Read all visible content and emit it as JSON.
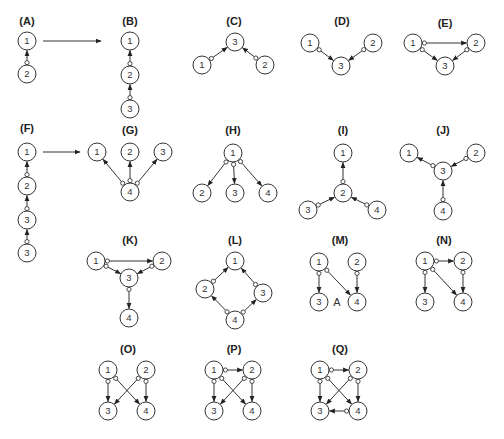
{
  "figure": {
    "node_radius": 9,
    "panels": [
      {
        "id": "A",
        "label": "(A)",
        "lx": 27,
        "ly": 25,
        "nodes": [
          {
            "n": "1",
            "x": 27,
            "y": 41
          },
          {
            "n": "2",
            "x": 27,
            "y": 74
          }
        ],
        "edges": [
          [
            "2",
            "1"
          ]
        ]
      },
      {
        "id": "B",
        "label": "(B)",
        "lx": 130,
        "ly": 25,
        "nodes": [
          {
            "n": "1",
            "x": 130,
            "y": 41
          },
          {
            "n": "2",
            "x": 130,
            "y": 75
          },
          {
            "n": "3",
            "x": 130,
            "y": 109
          }
        ],
        "edges": [
          [
            "2",
            "1"
          ],
          [
            "3",
            "2"
          ]
        ]
      },
      {
        "id": "C",
        "label": "(C)",
        "lx": 234,
        "ly": 25,
        "nodes": [
          {
            "n": "3",
            "x": 235,
            "y": 42
          },
          {
            "n": "1",
            "x": 202,
            "y": 65
          },
          {
            "n": "2",
            "x": 265,
            "y": 65
          }
        ],
        "edges": [
          [
            "1",
            "3"
          ],
          [
            "2",
            "3"
          ]
        ]
      },
      {
        "id": "D",
        "label": "(D)",
        "lx": 342,
        "ly": 25,
        "nodes": [
          {
            "n": "1",
            "x": 310,
            "y": 43
          },
          {
            "n": "2",
            "x": 373,
            "y": 43
          },
          {
            "n": "3",
            "x": 341,
            "y": 66
          }
        ],
        "edges": [
          [
            "1",
            "3"
          ],
          [
            "2",
            "3"
          ]
        ]
      },
      {
        "id": "E",
        "label": "(E)",
        "lx": 445,
        "ly": 27,
        "nodes": [
          {
            "n": "1",
            "x": 413,
            "y": 43
          },
          {
            "n": "2",
            "x": 476,
            "y": 43
          },
          {
            "n": "3",
            "x": 445,
            "y": 66
          }
        ],
        "edges": [
          [
            "1",
            "2"
          ],
          [
            "1",
            "3"
          ],
          [
            "2",
            "3"
          ]
        ]
      },
      {
        "id": "F",
        "label": "(F)",
        "lx": 27,
        "ly": 132,
        "nodes": [
          {
            "n": "1",
            "x": 27,
            "y": 152
          },
          {
            "n": "2",
            "x": 27,
            "y": 186
          },
          {
            "n": "3",
            "x": 27,
            "y": 220
          },
          {
            "n": "3",
            "x": 27,
            "y": 253
          }
        ],
        "edges": [
          [
            "2",
            "1",
            1,
            0
          ],
          [
            "3",
            "2",
            2,
            1
          ],
          [
            "3",
            "3",
            3,
            2
          ]
        ]
      },
      {
        "id": "G",
        "label": "(G)",
        "lx": 130,
        "ly": 134,
        "nodes": [
          {
            "n": "1",
            "x": 97,
            "y": 152
          },
          {
            "n": "2",
            "x": 130,
            "y": 152
          },
          {
            "n": "3",
            "x": 163,
            "y": 152
          },
          {
            "n": "4",
            "x": 130,
            "y": 192
          }
        ],
        "edges": [
          [
            "4",
            "1"
          ],
          [
            "4",
            "2"
          ],
          [
            "4",
            "3"
          ]
        ],
        "shared_tail": true
      },
      {
        "id": "H",
        "label": "(H)",
        "lx": 233,
        "ly": 134,
        "nodes": [
          {
            "n": "1",
            "x": 233,
            "y": 153
          },
          {
            "n": "2",
            "x": 202,
            "y": 193
          },
          {
            "n": "3",
            "x": 235,
            "y": 193
          },
          {
            "n": "4",
            "x": 268,
            "y": 193
          }
        ],
        "edges": [
          [
            "1",
            "2"
          ],
          [
            "1",
            "3"
          ],
          [
            "1",
            "4"
          ]
        ],
        "shared_tail": true
      },
      {
        "id": "I",
        "label": "(I)",
        "lx": 343,
        "ly": 134,
        "nodes": [
          {
            "n": "1",
            "x": 343,
            "y": 153
          },
          {
            "n": "2",
            "x": 343,
            "y": 193
          },
          {
            "n": "3",
            "x": 308,
            "y": 210
          },
          {
            "n": "4",
            "x": 377,
            "y": 210
          }
        ],
        "edges": [
          [
            "2",
            "1"
          ],
          [
            "3",
            "2"
          ],
          [
            "4",
            "2"
          ]
        ]
      },
      {
        "id": "J",
        "label": "(J)",
        "lx": 443,
        "ly": 134,
        "nodes": [
          {
            "n": "1",
            "x": 409,
            "y": 153
          },
          {
            "n": "2",
            "x": 476,
            "y": 153
          },
          {
            "n": "3",
            "x": 443,
            "y": 171
          },
          {
            "n": "4",
            "x": 443,
            "y": 211
          }
        ],
        "edges": [
          [
            "3",
            "1"
          ],
          [
            "2",
            "3"
          ],
          [
            "4",
            "3"
          ]
        ]
      },
      {
        "id": "K",
        "label": "(K)",
        "lx": 130,
        "ly": 244,
        "nodes": [
          {
            "n": "1",
            "x": 96,
            "y": 261
          },
          {
            "n": "2",
            "x": 162,
            "y": 261
          },
          {
            "n": "3",
            "x": 129,
            "y": 278
          },
          {
            "n": "4",
            "x": 129,
            "y": 318
          }
        ],
        "edges": [
          [
            "1",
            "2"
          ],
          [
            "1",
            "3"
          ],
          [
            "2",
            "3"
          ],
          [
            "3",
            "4"
          ]
        ]
      },
      {
        "id": "L",
        "label": "(L)",
        "lx": 235,
        "ly": 244,
        "nodes": [
          {
            "n": "1",
            "x": 235,
            "y": 261
          },
          {
            "n": "2",
            "x": 205,
            "y": 289
          },
          {
            "n": "3",
            "x": 263,
            "y": 293
          },
          {
            "n": "4",
            "x": 235,
            "y": 320
          }
        ],
        "edges": [
          [
            "2",
            "1"
          ],
          [
            "3",
            "1"
          ],
          [
            "4",
            "2"
          ],
          [
            "4",
            "3"
          ]
        ],
        "shared_tail_from": "4"
      },
      {
        "id": "M",
        "label": "(M)",
        "lx": 340,
        "ly": 244,
        "nodes": [
          {
            "n": "1",
            "x": 319,
            "y": 262
          },
          {
            "n": "2",
            "x": 357,
            "y": 262
          },
          {
            "n": "3",
            "x": 319,
            "y": 302
          },
          {
            "n": "4",
            "x": 357,
            "y": 302
          }
        ],
        "edges": [
          [
            "1",
            "3"
          ],
          [
            "1",
            "4"
          ],
          [
            "2",
            "4"
          ]
        ],
        "annotation": {
          "text": "A",
          "x": 337,
          "y": 306
        }
      },
      {
        "id": "N",
        "label": "(N)",
        "lx": 444,
        "ly": 244,
        "nodes": [
          {
            "n": "1",
            "x": 425,
            "y": 261
          },
          {
            "n": "2",
            "x": 463,
            "y": 261
          },
          {
            "n": "3",
            "x": 425,
            "y": 302
          },
          {
            "n": "4",
            "x": 463,
            "y": 302
          }
        ],
        "edges": [
          [
            "1",
            "2"
          ],
          [
            "1",
            "3"
          ],
          [
            "1",
            "4"
          ],
          [
            "2",
            "4"
          ]
        ]
      },
      {
        "id": "O",
        "label": "(O)",
        "lx": 128,
        "ly": 353,
        "nodes": [
          {
            "n": "1",
            "x": 108,
            "y": 370
          },
          {
            "n": "2",
            "x": 146,
            "y": 370
          },
          {
            "n": "3",
            "x": 108,
            "y": 411
          },
          {
            "n": "4",
            "x": 146,
            "y": 411
          }
        ],
        "edges": [
          [
            "1",
            "3"
          ],
          [
            "1",
            "4"
          ],
          [
            "2",
            "3"
          ],
          [
            "2",
            "4"
          ]
        ]
      },
      {
        "id": "P",
        "label": "(P)",
        "lx": 234,
        "ly": 353,
        "nodes": [
          {
            "n": "1",
            "x": 214,
            "y": 370
          },
          {
            "n": "2",
            "x": 252,
            "y": 370
          },
          {
            "n": "3",
            "x": 214,
            "y": 411
          },
          {
            "n": "4",
            "x": 252,
            "y": 411
          }
        ],
        "edges": [
          [
            "1",
            "2"
          ],
          [
            "1",
            "3"
          ],
          [
            "1",
            "4"
          ],
          [
            "2",
            "3"
          ],
          [
            "2",
            "4"
          ]
        ]
      },
      {
        "id": "Q",
        "label": "(Q)",
        "lx": 340,
        "ly": 353,
        "nodes": [
          {
            "n": "1",
            "x": 320,
            "y": 370
          },
          {
            "n": "2",
            "x": 358,
            "y": 370
          },
          {
            "n": "3",
            "x": 320,
            "y": 411
          },
          {
            "n": "4",
            "x": 358,
            "y": 411
          }
        ],
        "edges": [
          [
            "1",
            "2"
          ],
          [
            "1",
            "3"
          ],
          [
            "1",
            "4"
          ],
          [
            "2",
            "3"
          ],
          [
            "2",
            "4"
          ],
          [
            "4",
            "3"
          ]
        ]
      }
    ],
    "transition_arrows": [
      {
        "from": "A",
        "to": "B",
        "x1": 43,
        "y1": 41,
        "x2": 101,
        "y2": 41
      },
      {
        "from": "F",
        "to": "G",
        "x1": 43,
        "y1": 152,
        "x2": 80,
        "y2": 152
      }
    ]
  }
}
